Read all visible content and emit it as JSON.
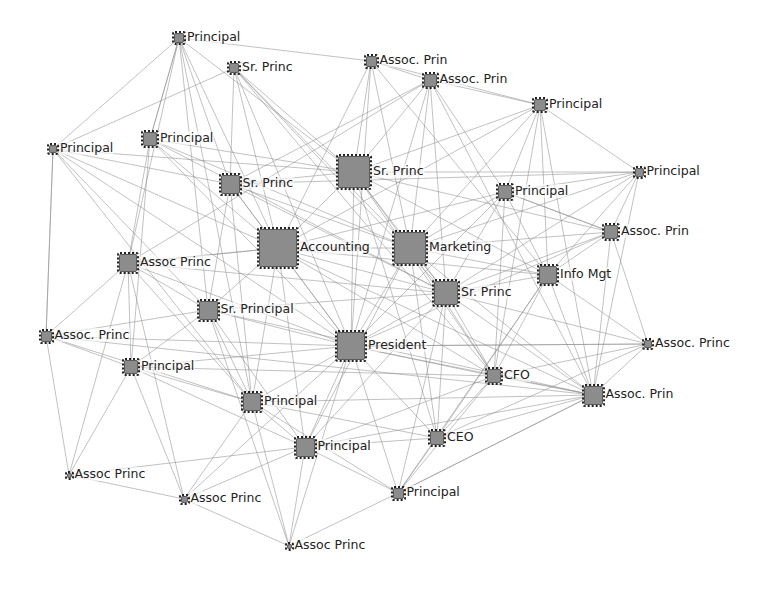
{
  "diagram": {
    "type": "directed-network",
    "node_color": "#8c8c8c",
    "edge_color": "#8a8a8a",
    "nodes": [
      {
        "id": "n1",
        "label": "Principal",
        "x": 179,
        "y": 38,
        "size": 10
      },
      {
        "id": "n2",
        "label": "Sr. Princ",
        "x": 234,
        "y": 68,
        "size": 10
      },
      {
        "id": "n3",
        "label": "Assoc. Prin",
        "x": 371,
        "y": 61,
        "size": 11
      },
      {
        "id": "n4",
        "label": "Assoc. Prin",
        "x": 430,
        "y": 80,
        "size": 13
      },
      {
        "id": "n5",
        "label": "Principal",
        "x": 540,
        "y": 105,
        "size": 12
      },
      {
        "id": "n6",
        "label": "Principal",
        "x": 53,
        "y": 149,
        "size": 8
      },
      {
        "id": "n7",
        "label": "Principal",
        "x": 150,
        "y": 139,
        "size": 14
      },
      {
        "id": "n8",
        "label": "Sr. Princ",
        "x": 354,
        "y": 172,
        "size": 32
      },
      {
        "id": "n9",
        "label": "Sr. Princ",
        "x": 230,
        "y": 184,
        "size": 19
      },
      {
        "id": "n10",
        "label": "Principal",
        "x": 639,
        "y": 172,
        "size": 9
      },
      {
        "id": "n11",
        "label": "Principal",
        "x": 505,
        "y": 192,
        "size": 14
      },
      {
        "id": "n12",
        "label": "Accounting",
        "x": 278,
        "y": 248,
        "size": 38
      },
      {
        "id": "n13",
        "label": "Marketing",
        "x": 410,
        "y": 248,
        "size": 32
      },
      {
        "id": "n14",
        "label": "Assoc. Prin",
        "x": 611,
        "y": 232,
        "size": 14
      },
      {
        "id": "n15",
        "label": "Assoc Princ",
        "x": 128,
        "y": 263,
        "size": 18
      },
      {
        "id": "n16",
        "label": "Info Mgt",
        "x": 548,
        "y": 275,
        "size": 18
      },
      {
        "id": "n17",
        "label": "Sr. Princ",
        "x": 446,
        "y": 293,
        "size": 24
      },
      {
        "id": "n18",
        "label": "Sr. Principal",
        "x": 208,
        "y": 310,
        "size": 19
      },
      {
        "id": "n19",
        "label": "Assoc. Princ",
        "x": 46,
        "y": 336,
        "size": 11
      },
      {
        "id": "n20",
        "label": "President",
        "x": 351,
        "y": 346,
        "size": 28
      },
      {
        "id": "n21",
        "label": "Assoc. Princ",
        "x": 648,
        "y": 344,
        "size": 8
      },
      {
        "id": "n22",
        "label": "Principal",
        "x": 131,
        "y": 367,
        "size": 14
      },
      {
        "id": "n23",
        "label": "CFO",
        "x": 494,
        "y": 376,
        "size": 14
      },
      {
        "id": "n24",
        "label": "Assoc. Prin",
        "x": 593,
        "y": 395,
        "size": 19
      },
      {
        "id": "n25",
        "label": "Principal",
        "x": 252,
        "y": 402,
        "size": 18
      },
      {
        "id": "n26",
        "label": "Principal",
        "x": 305,
        "y": 447,
        "size": 19
      },
      {
        "id": "n27",
        "label": "CEO",
        "x": 437,
        "y": 438,
        "size": 14
      },
      {
        "id": "n28",
        "label": "Assoc Princ",
        "x": 69,
        "y": 475,
        "size": 5
      },
      {
        "id": "n29",
        "label": "Assoc Princ",
        "x": 184,
        "y": 499,
        "size": 7
      },
      {
        "id": "n30",
        "label": "Principal",
        "x": 398,
        "y": 493,
        "size": 11
      },
      {
        "id": "n31",
        "label": "Assoc Princ",
        "x": 289,
        "y": 546,
        "size": 5
      }
    ],
    "edges": [
      [
        "n1",
        "n7"
      ],
      [
        "n1",
        "n9"
      ],
      [
        "n1",
        "n8"
      ],
      [
        "n1",
        "n15"
      ],
      [
        "n1",
        "n12"
      ],
      [
        "n1",
        "n3"
      ],
      [
        "n1",
        "n18"
      ],
      [
        "n1",
        "n25"
      ],
      [
        "n2",
        "n8"
      ],
      [
        "n2",
        "n12"
      ],
      [
        "n2",
        "n13"
      ],
      [
        "n2",
        "n17"
      ],
      [
        "n2",
        "n20"
      ],
      [
        "n2",
        "n9"
      ],
      [
        "n2",
        "n6"
      ],
      [
        "n2",
        "n23"
      ],
      [
        "n3",
        "n8"
      ],
      [
        "n3",
        "n5"
      ],
      [
        "n3",
        "n13"
      ],
      [
        "n3",
        "n20"
      ],
      [
        "n3",
        "n4"
      ],
      [
        "n3",
        "n12"
      ],
      [
        "n3",
        "n16"
      ],
      [
        "n4",
        "n5"
      ],
      [
        "n4",
        "n8"
      ],
      [
        "n4",
        "n13"
      ],
      [
        "n4",
        "n17"
      ],
      [
        "n4",
        "n11"
      ],
      [
        "n4",
        "n20"
      ],
      [
        "n4",
        "n24"
      ],
      [
        "n4",
        "n9"
      ],
      [
        "n4",
        "n15"
      ],
      [
        "n5",
        "n10"
      ],
      [
        "n5",
        "n11"
      ],
      [
        "n5",
        "n16"
      ],
      [
        "n5",
        "n13"
      ],
      [
        "n5",
        "n8"
      ],
      [
        "n5",
        "n23"
      ],
      [
        "n5",
        "n24"
      ],
      [
        "n5",
        "n12"
      ],
      [
        "n6",
        "n1"
      ],
      [
        "n6",
        "n8"
      ],
      [
        "n6",
        "n12"
      ],
      [
        "n6",
        "n19"
      ],
      [
        "n6",
        "n20"
      ],
      [
        "n6",
        "n25"
      ],
      [
        "n6",
        "n18"
      ],
      [
        "n6",
        "n9"
      ],
      [
        "n7",
        "n1"
      ],
      [
        "n7",
        "n8"
      ],
      [
        "n7",
        "n12"
      ],
      [
        "n7",
        "n17"
      ],
      [
        "n7",
        "n20"
      ],
      [
        "n7",
        "n15"
      ],
      [
        "n7",
        "n22"
      ],
      [
        "n7",
        "n13"
      ],
      [
        "n8",
        "n12"
      ],
      [
        "n8",
        "n13"
      ],
      [
        "n8",
        "n17"
      ],
      [
        "n8",
        "n20"
      ],
      [
        "n8",
        "n16"
      ],
      [
        "n8",
        "n14"
      ],
      [
        "n8",
        "n23"
      ],
      [
        "n8",
        "n27"
      ],
      [
        "n8",
        "n10"
      ],
      [
        "n9",
        "n12"
      ],
      [
        "n9",
        "n8"
      ],
      [
        "n9",
        "n13"
      ],
      [
        "n9",
        "n20"
      ],
      [
        "n9",
        "n17"
      ],
      [
        "n9",
        "n18"
      ],
      [
        "n9",
        "n25"
      ],
      [
        "n10",
        "n14"
      ],
      [
        "n10",
        "n16"
      ],
      [
        "n10",
        "n11"
      ],
      [
        "n10",
        "n13"
      ],
      [
        "n10",
        "n9"
      ],
      [
        "n10",
        "n24"
      ],
      [
        "n10",
        "n17"
      ],
      [
        "n11",
        "n13"
      ],
      [
        "n11",
        "n16"
      ],
      [
        "n11",
        "n14"
      ],
      [
        "n11",
        "n17"
      ],
      [
        "n11",
        "n12"
      ],
      [
        "n11",
        "n23"
      ],
      [
        "n11",
        "n20"
      ],
      [
        "n12",
        "n13"
      ],
      [
        "n12",
        "n20"
      ],
      [
        "n12",
        "n17"
      ],
      [
        "n12",
        "n18"
      ],
      [
        "n12",
        "n15"
      ],
      [
        "n12",
        "n16"
      ],
      [
        "n12",
        "n25"
      ],
      [
        "n12",
        "n26"
      ],
      [
        "n12",
        "n23"
      ],
      [
        "n12",
        "n24"
      ],
      [
        "n13",
        "n17"
      ],
      [
        "n13",
        "n16"
      ],
      [
        "n13",
        "n14"
      ],
      [
        "n13",
        "n20"
      ],
      [
        "n13",
        "n23"
      ],
      [
        "n13",
        "n24"
      ],
      [
        "n13",
        "n27"
      ],
      [
        "n13",
        "n26"
      ],
      [
        "n14",
        "n16"
      ],
      [
        "n14",
        "n21"
      ],
      [
        "n14",
        "n24"
      ],
      [
        "n14",
        "n17"
      ],
      [
        "n14",
        "n20"
      ],
      [
        "n14",
        "n11"
      ],
      [
        "n15",
        "n18"
      ],
      [
        "n15",
        "n12"
      ],
      [
        "n15",
        "n20"
      ],
      [
        "n15",
        "n22"
      ],
      [
        "n15",
        "n25"
      ],
      [
        "n15",
        "n17"
      ],
      [
        "n15",
        "n29"
      ],
      [
        "n15",
        "n28"
      ],
      [
        "n16",
        "n21"
      ],
      [
        "n16",
        "n24"
      ],
      [
        "n16",
        "n23"
      ],
      [
        "n16",
        "n17"
      ],
      [
        "n16",
        "n27"
      ],
      [
        "n16",
        "n30"
      ],
      [
        "n17",
        "n20"
      ],
      [
        "n17",
        "n23"
      ],
      [
        "n17",
        "n21"
      ],
      [
        "n17",
        "n24"
      ],
      [
        "n17",
        "n27"
      ],
      [
        "n17",
        "n26"
      ],
      [
        "n17",
        "n30"
      ],
      [
        "n18",
        "n20"
      ],
      [
        "n18",
        "n25"
      ],
      [
        "n18",
        "n26"
      ],
      [
        "n18",
        "n22"
      ],
      [
        "n18",
        "n24"
      ],
      [
        "n18",
        "n17"
      ],
      [
        "n18",
        "n31"
      ],
      [
        "n19",
        "n15"
      ],
      [
        "n19",
        "n22"
      ],
      [
        "n19",
        "n25"
      ],
      [
        "n19",
        "n18"
      ],
      [
        "n19",
        "n28"
      ],
      [
        "n19",
        "n6"
      ],
      [
        "n19",
        "n24"
      ],
      [
        "n19",
        "n20"
      ],
      [
        "n20",
        "n23"
      ],
      [
        "n20",
        "n24"
      ],
      [
        "n20",
        "n26"
      ],
      [
        "n20",
        "n27"
      ],
      [
        "n20",
        "n30"
      ],
      [
        "n20",
        "n25"
      ],
      [
        "n20",
        "n21"
      ],
      [
        "n21",
        "n24"
      ],
      [
        "n21",
        "n23"
      ],
      [
        "n21",
        "n20"
      ],
      [
        "n21",
        "n27"
      ],
      [
        "n22",
        "n25"
      ],
      [
        "n22",
        "n26"
      ],
      [
        "n22",
        "n20"
      ],
      [
        "n22",
        "n29"
      ],
      [
        "n22",
        "n28"
      ],
      [
        "n22",
        "n23"
      ],
      [
        "n23",
        "n24"
      ],
      [
        "n23",
        "n27"
      ],
      [
        "n23",
        "n26"
      ],
      [
        "n23",
        "n30"
      ],
      [
        "n24",
        "n27"
      ],
      [
        "n24",
        "n26"
      ],
      [
        "n24",
        "n30"
      ],
      [
        "n24",
        "n25"
      ],
      [
        "n25",
        "n26"
      ],
      [
        "n25",
        "n27"
      ],
      [
        "n25",
        "n29"
      ],
      [
        "n25",
        "n31"
      ],
      [
        "n25",
        "n30"
      ],
      [
        "n26",
        "n27"
      ],
      [
        "n26",
        "n30"
      ],
      [
        "n26",
        "n31"
      ],
      [
        "n26",
        "n29"
      ],
      [
        "n27",
        "n30"
      ],
      [
        "n28",
        "n29"
      ],
      [
        "n29",
        "n31"
      ],
      [
        "n31",
        "n30"
      ],
      [
        "n28",
        "n26"
      ],
      [
        "n29",
        "n20"
      ],
      [
        "n31",
        "n20"
      ],
      [
        "n30",
        "n24"
      ]
    ]
  }
}
